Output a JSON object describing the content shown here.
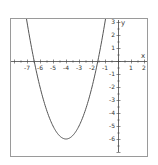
{
  "chart_data": {
    "type": "line",
    "title": "",
    "xlabel": "x",
    "ylabel": "y",
    "xlim": [
      -8,
      2.2
    ],
    "ylim": [
      -7,
      3
    ],
    "grid": false,
    "legend": null,
    "x_ticks": [
      -7,
      -6,
      -5,
      -4,
      -3,
      -2,
      -1,
      1,
      2
    ],
    "y_ticks": [
      3,
      2,
      1,
      -1,
      -2,
      -3,
      -4,
      -5,
      -6
    ],
    "series": [
      {
        "name": "y = x^2 + 8x + 10",
        "equation": "y = (x + 4)^2 - 6",
        "vertex": [
          -4,
          -6
        ],
        "roots": [
          -6.45,
          -1.55
        ],
        "x": [
          -7.35,
          -7,
          -6.5,
          -6,
          -5.5,
          -5,
          -4.5,
          -4,
          -3.5,
          -3,
          -2.5,
          -2,
          -1.5,
          -1,
          -0.65
        ],
        "y": [
          5.22,
          3,
          0.25,
          -2,
          -3.75,
          -5,
          -5.75,
          -6,
          -5.75,
          -5,
          -3.75,
          -2,
          0.25,
          3,
          5.22
        ],
        "color": "#555555"
      }
    ]
  },
  "colors": {
    "frame": "#9a9a9a",
    "axis": "#444444",
    "curve": "#555555"
  }
}
